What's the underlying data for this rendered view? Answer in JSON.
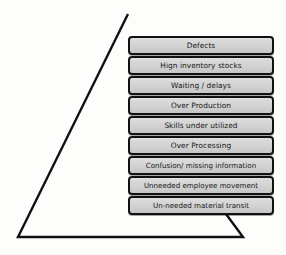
{
  "diagram": {
    "shape": "triangle",
    "background_color": "#fdfdfc",
    "outline_color": "#111111",
    "box_fill_color": "#d4d4d4",
    "box_border_color": "#111111",
    "text_color": "#141414"
  },
  "boxes": [
    {
      "label": "Defects"
    },
    {
      "label": "Hign inventory stocks"
    },
    {
      "label": "Waiting / delays"
    },
    {
      "label": "Over Production"
    },
    {
      "label": "Skills under utilized"
    },
    {
      "label": "Over Processing"
    },
    {
      "label": "Confusion/ missing information"
    },
    {
      "label": "Unneeded employee movement"
    },
    {
      "label": "Un-needed material transit"
    }
  ]
}
